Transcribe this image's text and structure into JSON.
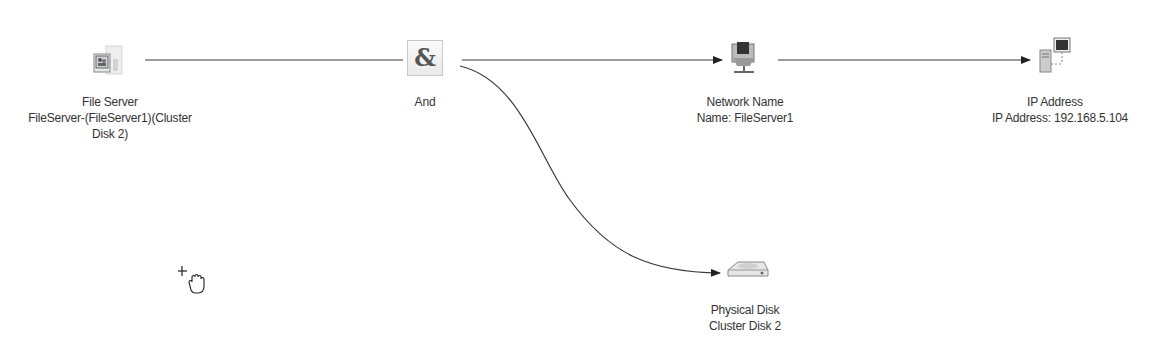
{
  "diagram": {
    "type": "dependency-report",
    "nodes": [
      {
        "id": "file-server",
        "icon": "file-server-icon",
        "title": "File Server",
        "subtitle_line1": "FileServer-(FileServer1)(Cluster",
        "subtitle_line2": "Disk 2)"
      },
      {
        "id": "and",
        "icon": "and-operator-icon",
        "glyph": "&",
        "title": "And"
      },
      {
        "id": "network-name",
        "icon": "network-name-icon",
        "title": "Network Name",
        "subtitle_line1": "Name: FileServer1"
      },
      {
        "id": "ip-address",
        "icon": "ip-address-icon",
        "title": "IP Address",
        "subtitle_line1": "IP Address: 192.168.5.104"
      },
      {
        "id": "physical-disk",
        "icon": "physical-disk-icon",
        "title": "Physical Disk",
        "subtitle_line1": "Cluster Disk 2"
      }
    ],
    "edges": [
      {
        "from": "file-server",
        "to": "and",
        "arrow": false
      },
      {
        "from": "and",
        "to": "network-name",
        "arrow": true
      },
      {
        "from": "network-name",
        "to": "ip-address",
        "arrow": true
      },
      {
        "from": "and",
        "to": "physical-disk",
        "arrow": true,
        "curved": true
      }
    ],
    "colors": {
      "edge": "#3a3a3a",
      "text": "#333333",
      "background": "#ffffff"
    }
  },
  "cursor": {
    "icon": "hand-move-cursor-icon"
  }
}
